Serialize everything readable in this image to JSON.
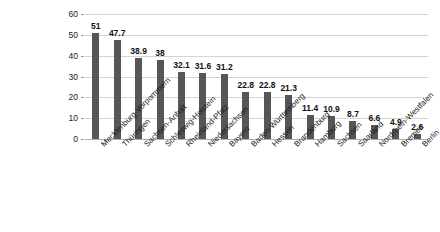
{
  "chart_data": {
    "type": "bar",
    "title": "",
    "subtitle": "",
    "xlabel": "",
    "ylabel": "",
    "ylim": [
      0,
      60
    ],
    "yticks": [
      0,
      10,
      20,
      30,
      40,
      50,
      60
    ],
    "ytick_labels": [
      "0",
      "10",
      "20",
      "30",
      "40",
      "50",
      "60"
    ],
    "grid": true,
    "legend": "none",
    "orientation": "vertical",
    "bar_color": "#565656",
    "gridline_color": "#d4d4d4",
    "background_color": "#ffffff",
    "categories": [
      "Mecklenburg-Vorpommern",
      "Thüringen",
      "Sachsen-Anhalt",
      "Schleswig-Holstein",
      "Rheinland-Pfalz",
      "Niedersachsen",
      "Bayern",
      "Baden-Württemberg",
      "Hessen",
      "Brandenburg",
      "Hamburg",
      "Sachsen",
      "Saarland",
      "Nordrhein-Westfalen",
      "Bremen",
      "Berlin"
    ],
    "values": [
      51,
      47.7,
      38.9,
      38,
      32.1,
      31.6,
      31.2,
      22.8,
      22.8,
      21.3,
      11.4,
      10.9,
      8.7,
      6.6,
      4.9,
      2.6
    ],
    "value_labels": [
      "51",
      "47.7",
      "38.9",
      "38",
      "32.1",
      "31.6",
      "31.2",
      "22.8",
      "22.8",
      "21.3",
      "11.4",
      "10.9",
      "8.7",
      "6.6",
      "4.9",
      "2.6"
    ]
  }
}
